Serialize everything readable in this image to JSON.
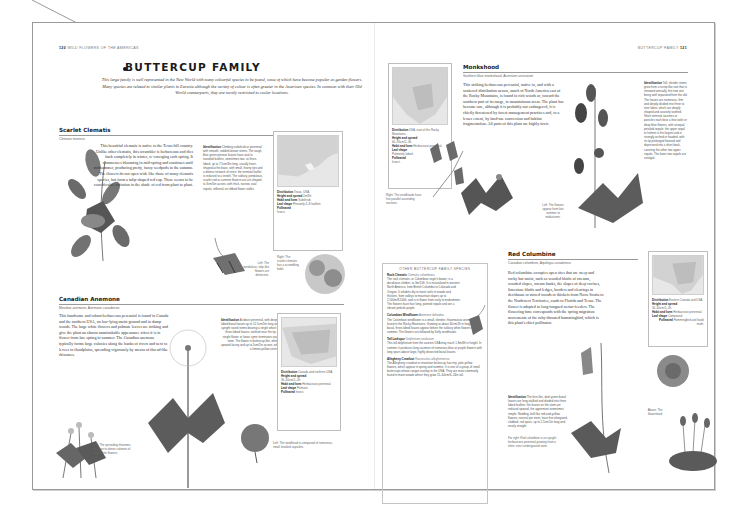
{
  "left_page": {
    "folio_number": "120",
    "folio_label": "WILD FLOWERS OF THE AMERICAS",
    "family_title": "BUTTERCUP FAMILY",
    "family_intro": "This large family is well represented in the New World with many colourful species to be found, some of which have become popular as garden flowers. Many species are related to similar plants in Eurasia although the variety of colour is often greater in the American species. In common with their Old World counterparts, they are mostly restricted to cooler locations.",
    "species": [
      {
        "name": "Scarlet Clematis",
        "subtitle": "Clematis texensis",
        "body": "This beautiful clematis is native to the Texas hill country. Unlike other clematis, this scrambler is herbaceous and dies back completely in winter, re-emerging each spring. It commences blooming in mid-spring and continues until midsummer, producing pretty, fuzzy seedpods in the autumn. The flowers do not open wide like those of many clematis species, but form a tulip-shaped red cap. There seems to be considerable variation in the shade of red from plant to plant.",
        "identification_label": "Identification",
        "identification": "Climbing subshrub or perennial with smooth, reddish-brown stems. The tough, blue-green pinnate leaves have oval to rounded leaflets, sometimes two- to three-lobed, up to 7.5cm/3in long, usually heart-shaped at the base, with small, thorny tips and a distinct network of veins; the terminal leaflet is reduced to a tendril. The solitary, pendulous, scarlet-red or carmine flowers are urn-shaped, to 3cm/5in across, with thick, narrow, oval sepals, reflexed, on ribbed flower stalks.",
        "caption_left": "Left: The pendulous, tulip-like flowers are distinctive.",
        "caption_right": "Right: The scarlet clematis has a scrambling habit.",
        "facts": {
          "distribution_label": "Distribution",
          "distribution": "Texas, USA.",
          "height_label": "Height and spread",
          "height": "2m/6ft.",
          "habit_label": "Habit and form",
          "habit": "Subshrub.",
          "leaf_label": "Leaf shape",
          "leaf": "Pinnately 4–8 leaflets.",
          "pollinated_label": "Pollinated",
          "pollinated": "Insect."
        }
      },
      {
        "name": "Canadian Anemone",
        "subtitle": "Meadow anemone, Anemone canadensis",
        "body": "This handsome and robust herbaceous perennial is found in Canada and the northern USA, on low-lying moist ground and in damp woods. The large white flowers and palmate leaves are striking and give the plant an almost unmistakable appearance when it is in flower from late spring to summer. The Canadian anemone typically forms large colonies along the banks of rivers and next to levees in floodplains, spreading vigorously by means of thread-like rhizomes.",
        "identification_label": "Identification",
        "identification": "A robust perennial, with deeply lobed basal leaves up to 12.5cm/5in long and upright round stems bearing a single whorl of three-lobed leaves, toothed near the tip. A single flower or loose cyme terminates each stem. The flower is buttercup-like, white, upward-facing and up to 5cm/2in across, with a lemon-yellow centre.",
        "caption_left": "Left: The spreading rhizomes give rise to dense colonies of large white flowers.",
        "caption_right": "Left: The seedhead is composed of numerous, small, beaked capsules.",
        "facts": {
          "distribution_label": "Distribution",
          "distribution": "Canada and northern USA.",
          "height_label": "Height and spread",
          "height": "30–60cm/1–2ft.",
          "habit_label": "Habit and form",
          "habit": "Herbaceous perennial.",
          "leaf_label": "Leaf shape",
          "leaf": "Palmate.",
          "pollinated_label": "Pollinated",
          "pollinated": "Insect."
        }
      }
    ]
  },
  "right_page": {
    "folio_label": "BUTTERCUP FAMILY",
    "folio_number": "121",
    "species": [
      {
        "name": "Monkshood",
        "subtitle": "Southern blue monkshood, Aconitum uncinatum",
        "body": "This striking herbaceous perennial, native to, and with a scattered distribution across, much of North America east of the Rocky Mountains, is found in rich woods or, toward the southern part of its range, in mountainous areas. The plant has become rare, although it is probably not endangered, it is chiefly threatened by forest management practices and, to a lesser extent, by land-use conversion and habitat fragmentation. All parts of this plant are highly toxic.",
        "identification_label": "Identification",
        "identification": "Tall, slender stems grow from a turnip-like root that is renewed annually, the new one being well separated from the old. The leaves are numerous, firm and deeply divided into three to nine lobes, which are deeply shaped and coarsely toothed. Short terminal racemes or panicles each bear a few violet or deep blue flowers, with unequal petaloid sepals: the upper sepal or helmet is the largest and is strongly arched or hooded, with its tip prolonged forward and depressed into a short beak, covering the other two upper sepals. The lower two sepals are vestigial.",
        "caption_left": "Left: The flowers appear from late summer to midautumn.",
        "caption_right": "Right: The seedheads have five parallel ascending sections.",
        "facts": {
          "distribution_label": "Distribution",
          "distribution": "USA, east of the Rocky Mountains.",
          "height_label": "Height and spread",
          "height": "60–90cm/2–3ft.",
          "habit_label": "Habit and form",
          "habit": "Herbaceous perennial.",
          "leaf_label": "Leaf shape",
          "leaf": "Palmately lobed.",
          "pollinated_label": "Pollinated",
          "pollinated": "Insect."
        }
      },
      {
        "name": "Red Columbine",
        "subtitle": "Canadian columbine, Aquilegia canadensis",
        "body": "Red columbine occupies open sites that are steep and rocky but moist, such as wooded bluffs of streams, wooded slopes, stream banks, the slopes of deep ravines, limestone bluffs and ledges, borders and clearings in deciduous or mixed woods or thickets from Nova Scotia to the Northwest Territories, south to Florida and Texas. The flower is adapted to long-tongued nectar-feeders. The flowering time corresponds with the spring migration movements of the ruby-throated hummingbird, which is this plant's chief pollinator.",
        "identification_label": "Identification",
        "identification": "The fern-like, dark green basal leaves are long-stalked and divided into three lobed leaflets; the leaves on the stem are reduced upward, the uppermost sometimes simple. Nodding, bell-like red-and-yellow flowers, several per stem, have five elongated, clubbed, red spurs, up to 2.5cm/1in long and nearly straight.",
        "caption_far_right": "Far right: Red columbine is an upright herbaceous perennial growing from a short, erect underground stem.",
        "caption_above": "Above: The flowerhead",
        "facts": {
          "distribution_label": "Distribution",
          "distribution": "Eastern Canada and USA.",
          "height_label": "Height and spread",
          "height": "30–60cm/1–2ft.",
          "habit_label": "Habit and form",
          "habit": "Herbaceous perennial.",
          "leaf_label": "Leaf shape",
          "leaf": "Compound.",
          "pollinated_label": "Pollinated",
          "pollinated": "Hummingbird and hawk moth."
        }
      }
    ],
    "other_species": {
      "heading": "OTHER BUTTERCUP FAMILY SPECIES",
      "items": [
        {
          "name": "Rock Clematis",
          "latin": "Clematis columbiana",
          "text": "The rock clematis, or Columbian virgin's bower, is a deciduous climber, to 3m/10ft. It is naturalized in western North America, from British Columbia to Colorado and Oregon. It inhabits dry to moist soils in woods and thickets, from valleys to mountain slopes up to 2,500m/8,200ft, and is in flower from early to midsummer. The flowers have four long, pointed sepals and are a vibrant pinkish-purple."
        },
        {
          "name": "Columbian Windflower",
          "latin": "Anemone deltoidea",
          "text": "The Columbian windflower is a small, slender, rhizomatous anemone found in the Rocky Mountains. Growing to about 30cm/1ft in height, the basal, three-lobed leaves appear before the solitary white flowers in summer. The flowers are followed by fluffy seedheads."
        },
        {
          "name": "Tall Larkspur",
          "latin": "Delphinium exaltatum",
          "text": "This tall delphinium from the eastern USA may reach 1.8m/6ft in height. In summer it produces long racemes of numerous blue or purple flowers with long spurs above large, highly dissected basal leaves."
        },
        {
          "name": "Allegheny Crowfoot",
          "latin": "Ranunculus allegheniensis",
          "text": "The Allegheny crowfoot or mountain buttercup has tiny, pale yellow flowers, which appear in spring and summer. It is one of a group of small buttercups whose ranges overlap in the USA. They are most commonly found in moist woods where they grow 15–60cm/6–24in tall."
        }
      ]
    }
  },
  "colors": {
    "page_border": "#9a9a9a",
    "map_fill": "#e7e7e7",
    "land_fill": "#cfcfcf",
    "title_text": "#1a1a1a"
  }
}
